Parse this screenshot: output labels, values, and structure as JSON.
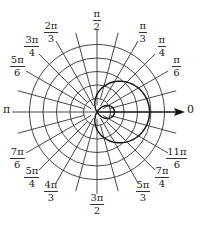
{
  "diagram": {
    "circle_count": 5,
    "spoke_step_degrees": 15,
    "curve": {
      "equation": "r = 1 + 2cos(θ)",
      "type": "limaçon with inner loop"
    },
    "axis_arrow_label": "0",
    "left_label": "π",
    "angle_labels": [
      {
        "id": "pi-2",
        "num": "π",
        "den": "2",
        "deg": 90
      },
      {
        "id": "pi-3",
        "num": "π",
        "den": "3",
        "deg": 60
      },
      {
        "id": "pi-4",
        "num": "π",
        "den": "4",
        "deg": 45
      },
      {
        "id": "pi-6",
        "num": "π",
        "den": "6",
        "deg": 30
      },
      {
        "id": "2pi-3",
        "num": "2π",
        "den": "3",
        "deg": 120
      },
      {
        "id": "3pi-4",
        "num": "3π",
        "den": "4",
        "deg": 135
      },
      {
        "id": "5pi-6",
        "num": "5π",
        "den": "6",
        "deg": 150
      },
      {
        "id": "7pi-6",
        "num": "7π",
        "den": "6",
        "deg": 210
      },
      {
        "id": "5pi-4",
        "num": "5π",
        "den": "4",
        "deg": 225
      },
      {
        "id": "4pi-3",
        "num": "4π",
        "den": "3",
        "deg": 240
      },
      {
        "id": "3pi-2",
        "num": "3π",
        "den": "2",
        "deg": 270
      },
      {
        "id": "5pi-3",
        "num": "5π",
        "den": "3",
        "deg": 300
      },
      {
        "id": "7pi-4",
        "num": "7π",
        "den": "4",
        "deg": 315
      },
      {
        "id": "11pi-6",
        "num": "11π",
        "den": "6",
        "deg": 330
      }
    ]
  }
}
